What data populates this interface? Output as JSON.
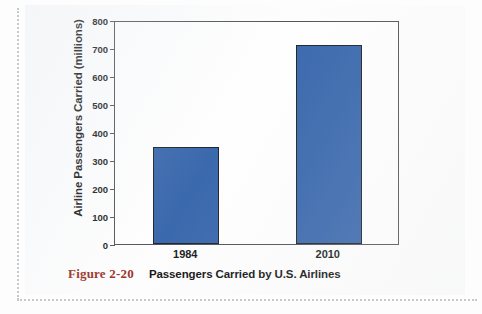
{
  "figure": {
    "caption_number": "Figure 2-20",
    "caption_text": "Passengers Carried by U.S. Airlines"
  },
  "colors": {
    "bar_fill": "#3b69ad",
    "bar_stroke": "#23252c",
    "axis": "#54555a",
    "caption_number": "#9c3128",
    "text": "#1b1b1b"
  },
  "chart_data": {
    "type": "bar",
    "title": "Passengers Carried by U.S. Airlines",
    "xlabel": "",
    "ylabel": "Airline Passengers Carried (millions)",
    "categories": [
      "1984",
      "2010"
    ],
    "values": [
      348,
      710
    ],
    "ylim": [
      0,
      800
    ],
    "yticks": [
      0,
      100,
      200,
      300,
      400,
      500,
      600,
      700,
      800
    ],
    "ytick_labels": [
      "0",
      "100",
      "200",
      "300",
      "400",
      "500",
      "600",
      "700",
      "800"
    ],
    "grid": false,
    "legend": false,
    "series": [
      {
        "name": "Airline Passengers Carried (millions)",
        "values": [
          348,
          710
        ]
      }
    ]
  }
}
